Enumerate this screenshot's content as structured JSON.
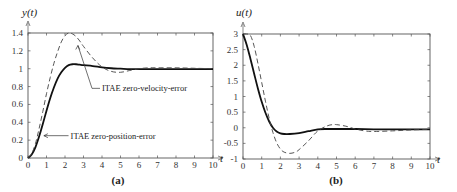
{
  "chart_data": [
    {
      "type": "line",
      "panel": "a",
      "caption": "(a)",
      "ylabel": "y(t)",
      "xlabel": "t",
      "xlim": [
        0,
        10
      ],
      "ylim": [
        0,
        1.4
      ],
      "xticks": [
        "0",
        "1",
        "2",
        "3",
        "4",
        "5",
        "6",
        "7",
        "8",
        "9",
        "10"
      ],
      "yticks": [
        "0",
        "0.2",
        "0.4",
        "0.6",
        "0.8",
        "1",
        "1.2",
        "1.4"
      ],
      "ytick_values": [
        0,
        0.2,
        0.4,
        0.6,
        0.8,
        1.0,
        1.2,
        1.4
      ],
      "grid": false,
      "series": [
        {
          "name": "ITAE zero-position-error",
          "style": "solid",
          "x": [
            0,
            0.2,
            0.4,
            0.6,
            0.8,
            1.0,
            1.2,
            1.4,
            1.6,
            1.8,
            2.0,
            2.2,
            2.4,
            2.6,
            2.8,
            3.0,
            3.5,
            4.0,
            4.5,
            5.0,
            5.5,
            6.0,
            7.0,
            8.0,
            9.0,
            10.0
          ],
          "values": [
            0,
            0.04,
            0.12,
            0.24,
            0.38,
            0.53,
            0.67,
            0.79,
            0.89,
            0.96,
            1.01,
            1.04,
            1.05,
            1.05,
            1.045,
            1.04,
            1.03,
            1.015,
            1.005,
            1.0,
            0.995,
            0.995,
            0.995,
            0.995,
            0.995,
            0.995
          ]
        },
        {
          "name": "ITAE zero-velocity-error",
          "style": "dashed",
          "x": [
            0,
            0.2,
            0.4,
            0.6,
            0.8,
            1.0,
            1.2,
            1.4,
            1.6,
            1.8,
            2.0,
            2.2,
            2.4,
            2.6,
            2.8,
            3.0,
            3.5,
            4.0,
            4.5,
            5.0,
            5.5,
            6.0,
            6.5,
            7.0,
            8.0,
            9.0,
            10.0
          ],
          "values": [
            0,
            0.05,
            0.16,
            0.33,
            0.52,
            0.72,
            0.9,
            1.06,
            1.19,
            1.3,
            1.37,
            1.4,
            1.39,
            1.36,
            1.31,
            1.25,
            1.12,
            1.02,
            0.97,
            0.96,
            0.98,
            1.0,
            1.01,
            1.01,
            1.01,
            1.005,
            1.0
          ]
        }
      ],
      "annotations": [
        {
          "text": "ITAE zero-velocity-error",
          "target_series": "ITAE zero-velocity-error",
          "target": [
            2.7,
            1.26
          ],
          "anchor": [
            4.0,
            0.78
          ]
        },
        {
          "text": "ITAE zero-position-error",
          "target_series": "ITAE zero-position-error",
          "target": [
            0.75,
            0.25
          ],
          "anchor": [
            2.3,
            0.25
          ]
        }
      ]
    },
    {
      "type": "line",
      "panel": "b",
      "caption": "(b)",
      "ylabel": "u(t)",
      "xlabel": "t",
      "xlim": [
        0,
        10
      ],
      "ylim": [
        -1,
        3
      ],
      "xticks": [
        "0",
        "1",
        "2",
        "3",
        "4",
        "5",
        "6",
        "7",
        "8",
        "9",
        "10"
      ],
      "yticks": [
        "-1",
        "-0.5",
        "0",
        "0.5",
        "1",
        "1.5",
        "2",
        "2.5",
        "3"
      ],
      "ytick_values": [
        -1,
        -0.5,
        0,
        0.5,
        1,
        1.5,
        2,
        2.5,
        3
      ],
      "grid": false,
      "series": [
        {
          "name": "ITAE zero-position-error",
          "style": "solid",
          "x": [
            0,
            0.2,
            0.4,
            0.6,
            0.8,
            1.0,
            1.2,
            1.4,
            1.6,
            1.8,
            2.0,
            2.2,
            2.5,
            3.0,
            3.5,
            4.0,
            4.5,
            5.0,
            6.0,
            7.0,
            8.0,
            9.0,
            10.0
          ],
          "values": [
            3.0,
            2.65,
            2.2,
            1.72,
            1.25,
            0.83,
            0.48,
            0.2,
            0.0,
            -0.12,
            -0.18,
            -0.2,
            -0.2,
            -0.17,
            -0.11,
            -0.05,
            -0.04,
            -0.04,
            -0.04,
            -0.05,
            -0.05,
            -0.05,
            -0.05
          ]
        },
        {
          "name": "ITAE zero-velocity-error",
          "style": "dashed",
          "x": [
            0,
            0.2,
            0.4,
            0.6,
            0.8,
            1.0,
            1.2,
            1.4,
            1.6,
            1.8,
            2.0,
            2.2,
            2.5,
            2.8,
            3.0,
            3.5,
            4.0,
            4.5,
            4.8,
            5.0,
            5.5,
            6.0,
            6.5,
            7.0,
            8.0,
            9.0,
            10.0
          ],
          "values": [
            3.0,
            3.0,
            2.95,
            2.6,
            2.05,
            1.45,
            0.85,
            0.3,
            -0.15,
            -0.48,
            -0.68,
            -0.78,
            -0.82,
            -0.78,
            -0.7,
            -0.42,
            -0.1,
            0.06,
            0.1,
            0.1,
            0.05,
            -0.04,
            -0.1,
            -0.12,
            -0.1,
            -0.07,
            -0.05
          ]
        }
      ]
    }
  ]
}
